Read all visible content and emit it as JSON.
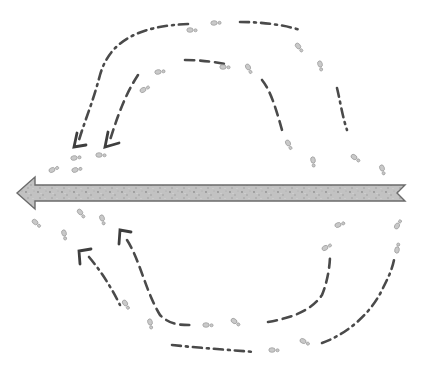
{
  "figure": {
    "main_arrow": {
      "direction": "left",
      "fill_color": "#bdbdbd",
      "stroke_color": "#6b6b6b"
    },
    "line_color": "#4a4a4a",
    "footprint_color": "#c9c9c9",
    "loops": [
      {
        "id": "upper-outer",
        "style": "dash-dot",
        "direction": "right-to-left over top"
      },
      {
        "id": "upper-inner",
        "style": "dashed",
        "direction": "right-to-left over top"
      },
      {
        "id": "lower-inner",
        "style": "dashed",
        "direction": "right-to-left under bottom"
      },
      {
        "id": "lower-outer",
        "style": "dash-dot",
        "direction": "right-to-left under bottom"
      }
    ]
  }
}
